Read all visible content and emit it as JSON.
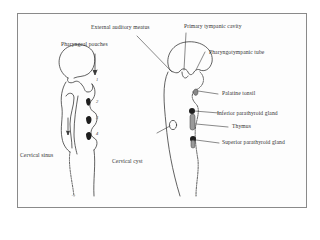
{
  "diagram": {
    "type": "embryology-anatomy-illustration",
    "left_figure": {
      "labels": {
        "pharyngeal_pouches": "Pharyngeal pouches",
        "cervical_sinus": "Cervical sinus"
      },
      "pouch_numbers": [
        "1",
        "2",
        "3",
        "4"
      ],
      "arrow_marker": "→←"
    },
    "right_figure": {
      "labels": {
        "external_auditory_meatus": "External auditory meatus",
        "primary_tympanic_cavity": "Primary tympanic cavity",
        "pharyngotympanic_tube": "Pharyngotympanic tube",
        "palatine_tonsil": "Palatine tonsil",
        "inferior_parathyroid_gland": "Inferior parathyroid gland",
        "thymus": "Thymus",
        "superior_parathyroid_gland": "Superior parathyroid gland",
        "cervical_cyst": "Cervical cyst"
      },
      "arrow_marker": "→"
    },
    "colors": {
      "line": "#3a3a3a",
      "fill_dark": "#1e1e1e",
      "frame": "#8a8a8a",
      "background": "#ffffff"
    }
  }
}
